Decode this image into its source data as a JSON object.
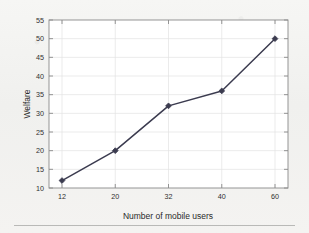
{
  "figure": {
    "background_color": "#f2f2f0",
    "plot_background_color": "#ffffff",
    "axis_color": "#8a8a8a",
    "grid_color": "#e2e2e2",
    "series_color": "#3b3b4f",
    "bottom_rule": "horizontal-rule"
  },
  "chart_data": {
    "type": "line",
    "title": "",
    "xlabel": "Number of mobile users",
    "ylabel": "Welfare",
    "categories": [
      "12",
      "20",
      "32",
      "40",
      "60"
    ],
    "x": [
      12,
      20,
      32,
      40,
      60
    ],
    "values": [
      12,
      20,
      32,
      36,
      50
    ],
    "series": [
      {
        "name": "Welfare",
        "values": [
          12,
          20,
          32,
          36,
          50
        ],
        "color": "#3b3b4f",
        "marker": "diamond",
        "line_style": "solid"
      }
    ],
    "xtick_labels": [
      "12",
      "20",
      "32",
      "40",
      "60"
    ],
    "ytick_labels": [
      "10",
      "15",
      "20",
      "25",
      "30",
      "35",
      "40",
      "45",
      "50",
      "55"
    ],
    "yticks": [
      10,
      15,
      20,
      25,
      30,
      35,
      40,
      45,
      50,
      55
    ],
    "ylim": [
      10,
      55
    ],
    "grid": true,
    "legend": null,
    "legend_position": "none"
  }
}
